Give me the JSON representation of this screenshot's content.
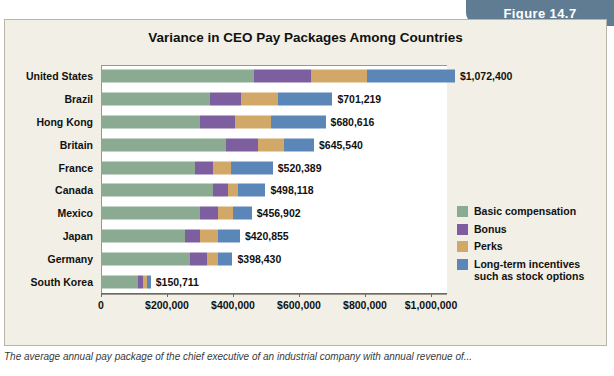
{
  "figure": {
    "label": "Figure 14.7"
  },
  "chart_data": {
    "type": "bar",
    "orientation": "horizontal",
    "title": "Variance in CEO Pay Packages Among Countries",
    "xlabel": "",
    "ylabel": "",
    "xlim": [
      0,
      1100000
    ],
    "xticks": [
      0,
      200000,
      400000,
      600000,
      800000,
      1000000
    ],
    "xticklabels": [
      "0",
      "$200,000",
      "$400,000",
      "$600,000",
      "$800,000",
      "$1,000,000"
    ],
    "grid": false,
    "legend_position": "right",
    "categories": [
      "United States",
      "Brazil",
      "Hong Kong",
      "Britain",
      "France",
      "Canada",
      "Mexico",
      "Japan",
      "Germany",
      "South Korea"
    ],
    "totals": [
      1072400,
      701219,
      680616,
      645540,
      520389,
      498118,
      456902,
      420855,
      398430,
      150711
    ],
    "total_labels": [
      "$1,072,400",
      "$701,219",
      "$680,616",
      "$645,540",
      "$520,389",
      "$498,118",
      "$456,902",
      "$420,855",
      "$398,430",
      "$150,711"
    ],
    "series": [
      {
        "name": "Basic compensation",
        "color": "#8aab92",
        "values": [
          465000,
          330000,
          300000,
          380000,
          285000,
          340000,
          300000,
          255000,
          270000,
          112000
        ]
      },
      {
        "name": "Bonus",
        "color": "#7d5fa0",
        "values": [
          170000,
          95000,
          105000,
          95000,
          55000,
          45000,
          55000,
          45000,
          50000,
          15000
        ]
      },
      {
        "name": "Perks",
        "color": "#d2a868",
        "values": [
          170000,
          110000,
          110000,
          80000,
          55000,
          30000,
          45000,
          55000,
          35000,
          12000
        ]
      },
      {
        "name": "Long-term incentives such as stock options",
        "color": "#5b87b8",
        "values": [
          267400,
          166219,
          165616,
          90540,
          125389,
          83118,
          56902,
          65855,
          43430,
          11711
        ]
      }
    ],
    "legend": [
      {
        "label": "Basic compensation",
        "color": "#8aab92"
      },
      {
        "label": "Bonus",
        "color": "#7d5fa0"
      },
      {
        "label": "Perks",
        "color": "#d2a868"
      },
      {
        "label": "Long-term incentives such as stock options",
        "color": "#5b87b8"
      }
    ]
  },
  "caption": {
    "text": "The average annual pay package of the chief executive of an industrial company with annual revenue of..."
  }
}
